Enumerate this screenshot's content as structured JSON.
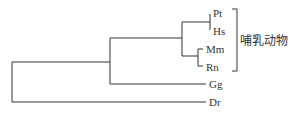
{
  "tree": {
    "leaves": [
      {
        "id": "Pt",
        "label": "Pt"
      },
      {
        "id": "Hs",
        "label": "Hs"
      },
      {
        "id": "Mm",
        "label": "Mm"
      },
      {
        "id": "Rn",
        "label": "Rn"
      },
      {
        "id": "Gg",
        "label": "Gg"
      },
      {
        "id": "Dr",
        "label": "Dr"
      }
    ],
    "newick": "((((Pt,Hs),(Mm,Rn)),Gg),Dr);",
    "group_label": "哺乳动物",
    "group_members": [
      "Pt",
      "Hs",
      "Mm",
      "Rn"
    ],
    "line_color": "#333333"
  }
}
